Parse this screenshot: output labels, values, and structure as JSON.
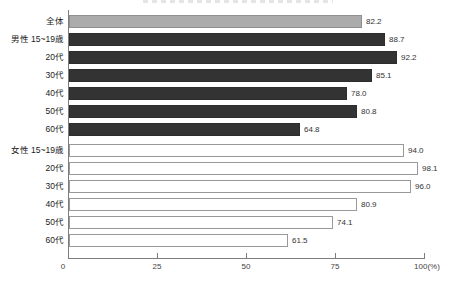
{
  "chart_data": {
    "type": "bar",
    "orientation": "horizontal",
    "categories": [
      "全体",
      "男性 15~19歳",
      "20代",
      "30代",
      "40代",
      "50代",
      "60代",
      "女性 15~19歳",
      "20代",
      "30代",
      "40代",
      "50代",
      "60代"
    ],
    "groups": [
      "total",
      "male",
      "male",
      "male",
      "male",
      "male",
      "male",
      "female",
      "female",
      "female",
      "female",
      "female",
      "female"
    ],
    "values": [
      82.2,
      88.7,
      92.2,
      85.1,
      78.0,
      80.8,
      64.8,
      94.0,
      98.1,
      96.0,
      80.9,
      74.1,
      61.5
    ],
    "value_labels": [
      "82.2",
      "88.7",
      "92.2",
      "85.1",
      "78.0",
      "80.8",
      "64.8",
      "94.0",
      "98.1",
      "96.0",
      "80.9",
      "74.1",
      "61.5"
    ],
    "x_ticks": [
      {
        "value": 0,
        "label": "0"
      },
      {
        "value": 25,
        "label": "25"
      },
      {
        "value": 50,
        "label": "50"
      },
      {
        "value": 75,
        "label": "75"
      },
      {
        "value": 100,
        "label": "100(%)"
      }
    ],
    "xlim": [
      0,
      100
    ],
    "grid": false,
    "legend": "none",
    "colors": {
      "total_fill": "#ababab",
      "total_border": "#8f8f8f",
      "male_fill": "#333333",
      "female_fill": "#ffffff",
      "female_border": "#999999",
      "axis": "#7d7d7d",
      "value_text": "#333333",
      "category_text": "#222222"
    }
  }
}
